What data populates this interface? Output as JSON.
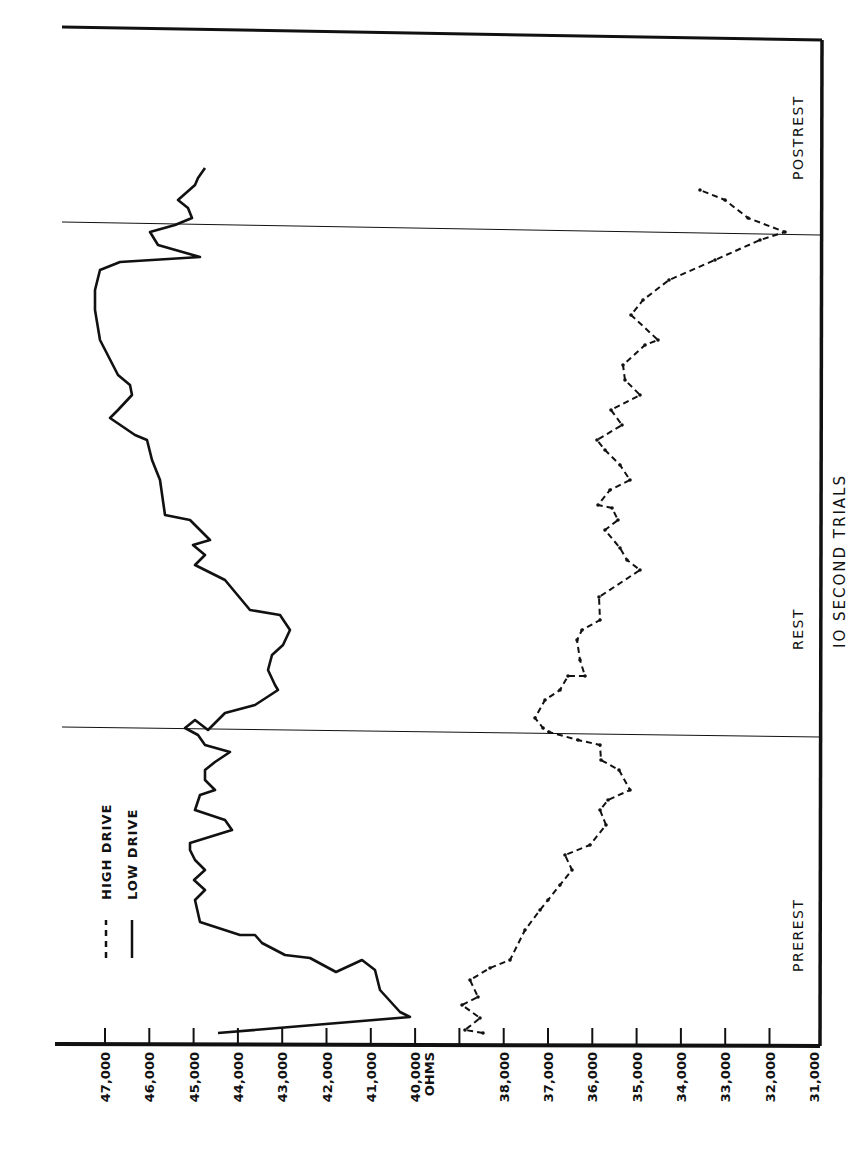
{
  "chart_data": {
    "type": "line",
    "title": "",
    "orientation": "rotated 90° counter-clockwise (value axis runs horizontally along bottom, trials run bottom-to-top)",
    "xlabel": "IO SECOND TRIALS",
    "ylabel": "OHMS",
    "ylim": [
      31000,
      47000
    ],
    "yticks": [
      "47,000",
      "46,000",
      "45,000",
      "44,000",
      "43,000",
      "42,000",
      "41,000",
      "40,000",
      "OHMS",
      "38,000",
      "37,000",
      "36,000",
      "35,000",
      "34,000",
      "33,000",
      "32,000",
      "31,000"
    ],
    "ytick_values": [
      47000,
      46000,
      45000,
      44000,
      43000,
      42000,
      41000,
      40000,
      39000,
      38000,
      37000,
      36000,
      35000,
      34000,
      33000,
      32000,
      31000
    ],
    "phases": [
      {
        "label": "PREREST",
        "start_frac": 0.0,
        "end_frac": 0.31
      },
      {
        "label": "REST",
        "start_frac": 0.31,
        "end_frac": 0.8
      },
      {
        "label": "POSTREST",
        "start_frac": 0.8,
        "end_frac": 1.0
      }
    ],
    "grid": false,
    "legend": {
      "position": "upper-left (rotated)",
      "entries": [
        {
          "label": "HIGH DRIVE",
          "style": "dashed"
        },
        {
          "label": "LOW DRIVE",
          "style": "solid"
        }
      ]
    },
    "series": [
      {
        "name": "LOW DRIVE",
        "style": "solid",
        "points_px": [
          [
            218,
            1033
          ],
          [
            410,
            1017
          ],
          [
            400,
            1012
          ],
          [
            380,
            990
          ],
          [
            375,
            970
          ],
          [
            362,
            960
          ],
          [
            336,
            972
          ],
          [
            310,
            958
          ],
          [
            285,
            955
          ],
          [
            262,
            943
          ],
          [
            255,
            935
          ],
          [
            240,
            935
          ],
          [
            200,
            922
          ],
          [
            195,
            900
          ],
          [
            205,
            890
          ],
          [
            194,
            880
          ],
          [
            205,
            870
          ],
          [
            195,
            860
          ],
          [
            190,
            850
          ],
          [
            190,
            843
          ],
          [
            232,
            830
          ],
          [
            225,
            820
          ],
          [
            195,
            810
          ],
          [
            200,
            795
          ],
          [
            215,
            790
          ],
          [
            205,
            780
          ],
          [
            205,
            770
          ],
          [
            215,
            762
          ],
          [
            230,
            752
          ],
          [
            205,
            745
          ],
          [
            198,
            735
          ],
          [
            185,
            728
          ],
          [
            195,
            720
          ],
          [
            208,
            730
          ],
          [
            225,
            713
          ],
          [
            255,
            705
          ],
          [
            278,
            690
          ],
          [
            275,
            685
          ],
          [
            268,
            670
          ],
          [
            272,
            655
          ],
          [
            283,
            645
          ],
          [
            290,
            630
          ],
          [
            280,
            615
          ],
          [
            250,
            610
          ],
          [
            225,
            580
          ],
          [
            195,
            565
          ],
          [
            205,
            555
          ],
          [
            193,
            545
          ],
          [
            210,
            540
          ],
          [
            190,
            520
          ],
          [
            165,
            515
          ],
          [
            160,
            480
          ],
          [
            152,
            460
          ],
          [
            147,
            440
          ],
          [
            135,
            435
          ],
          [
            110,
            418
          ],
          [
            118,
            410
          ],
          [
            132,
            395
          ],
          [
            130,
            385
          ],
          [
            118,
            375
          ],
          [
            100,
            340
          ],
          [
            95,
            310
          ],
          [
            95,
            290
          ],
          [
            100,
            270
          ],
          [
            120,
            262
          ],
          [
            200,
            257
          ],
          [
            158,
            245
          ],
          [
            150,
            232
          ],
          [
            175,
            225
          ],
          [
            192,
            218
          ],
          [
            188,
            208
          ],
          [
            178,
            200
          ],
          [
            195,
            185
          ],
          [
            198,
            178
          ],
          [
            205,
            168
          ]
        ]
      },
      {
        "name": "HIGH DRIVE",
        "style": "dashed",
        "points_px": [
          [
            483,
            1033
          ],
          [
            465,
            1030
          ],
          [
            480,
            1018
          ],
          [
            462,
            1005
          ],
          [
            478,
            997
          ],
          [
            470,
            980
          ],
          [
            490,
            968
          ],
          [
            510,
            960
          ],
          [
            525,
            930
          ],
          [
            540,
            910
          ],
          [
            548,
            900
          ],
          [
            560,
            885
          ],
          [
            572,
            870
          ],
          [
            565,
            855
          ],
          [
            590,
            845
          ],
          [
            606,
            825
          ],
          [
            600,
            810
          ],
          [
            608,
            800
          ],
          [
            630,
            790
          ],
          [
            619,
            770
          ],
          [
            601,
            760
          ],
          [
            600,
            745
          ],
          [
            578,
            740
          ],
          [
            549,
            732
          ],
          [
            543,
            728
          ],
          [
            535,
            718
          ],
          [
            545,
            700
          ],
          [
            560,
            690
          ],
          [
            568,
            676
          ],
          [
            585,
            676
          ],
          [
            580,
            660
          ],
          [
            577,
            640
          ],
          [
            582,
            630
          ],
          [
            600,
            620
          ],
          [
            599,
            597
          ],
          [
            640,
            570
          ],
          [
            627,
            560
          ],
          [
            620,
            548
          ],
          [
            605,
            530
          ],
          [
            618,
            520
          ],
          [
            612,
            508
          ],
          [
            598,
            505
          ],
          [
            610,
            490
          ],
          [
            630,
            480
          ],
          [
            620,
            465
          ],
          [
            605,
            450
          ],
          [
            597,
            440
          ],
          [
            622,
            425
          ],
          [
            611,
            410
          ],
          [
            640,
            395
          ],
          [
            625,
            380
          ],
          [
            623,
            365
          ],
          [
            645,
            345
          ],
          [
            658,
            340
          ],
          [
            631,
            315
          ],
          [
            643,
            300
          ],
          [
            669,
            280
          ],
          [
            715,
            260
          ],
          [
            760,
            240
          ],
          [
            785,
            232
          ],
          [
            748,
            218
          ],
          [
            725,
            200
          ],
          [
            700,
            190
          ]
        ]
      }
    ],
    "approx_values_summary": {
      "LOW DRIVE": {
        "prerest_start": 44500,
        "prerest_min": 40200,
        "prerest_plateau": 44600,
        "rest_start_min": 42700,
        "rest_peak": 47200,
        "postrest_dip": 44500,
        "end": 45200
      },
      "HIGH DRIVE": {
        "prerest_start": 38500,
        "prerest_min": 35200,
        "prerest_end": 37200,
        "rest_min": 34200,
        "rest_mid": 35500,
        "postrest_min": 31800,
        "end": 33800
      }
    }
  },
  "labels": {
    "legend_high": "HIGH DRIVE",
    "legend_low": "LOW DRIVE",
    "phase_prerest": "PREREST",
    "phase_rest": "REST",
    "phase_postrest": "POSTREST",
    "x_axis_title": "IO SECOND TRIALS"
  }
}
